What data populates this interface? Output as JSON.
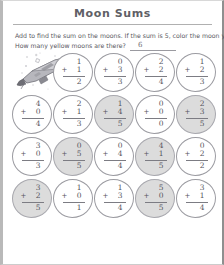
{
  "page": {
    "title": "Moon Sums",
    "instructions": {
      "line1": "Add to find the sum on the moons. If the sum is 5, color the moon yellow.",
      "line2": "How many yellow moons are there?",
      "answer": "6"
    },
    "illustration": "space-shuttle-illustration"
  },
  "colors": {
    "title": "#5f5f66",
    "text": "#57575e",
    "moon_outline": "#9b9ba1",
    "moon_colored_fill": "#dcdcdc",
    "rule": "#b0b0b0"
  },
  "symbols": {
    "plus": "+"
  },
  "rows": [
    {
      "leading_illustration": true,
      "moons": [
        {
          "a": "1",
          "b": "1",
          "sum": "2",
          "colored": false
        },
        {
          "a": "0",
          "b": "3",
          "sum": "3",
          "colored": false
        },
        {
          "a": "2",
          "b": "2",
          "sum": "4",
          "colored": false
        },
        {
          "a": "1",
          "b": "2",
          "sum": "3",
          "colored": false
        }
      ]
    },
    {
      "leading_illustration": false,
      "moons": [
        {
          "a": "4",
          "b": "0",
          "sum": "4",
          "colored": false
        },
        {
          "a": "2",
          "b": "1",
          "sum": "3",
          "colored": false
        },
        {
          "a": "1",
          "b": "4",
          "sum": "5",
          "colored": true
        },
        {
          "a": "0",
          "b": "0",
          "sum": "0",
          "colored": false
        },
        {
          "a": "2",
          "b": "3",
          "sum": "5",
          "colored": true
        }
      ]
    },
    {
      "leading_illustration": false,
      "moons": [
        {
          "a": "3",
          "b": "0",
          "sum": "3",
          "colored": false
        },
        {
          "a": "0",
          "b": "5",
          "sum": "5",
          "colored": true
        },
        {
          "a": "0",
          "b": "4",
          "sum": "4",
          "colored": false
        },
        {
          "a": "4",
          "b": "1",
          "sum": "5",
          "colored": true
        },
        {
          "a": "0",
          "b": "2",
          "sum": "2",
          "colored": false
        }
      ]
    },
    {
      "leading_illustration": false,
      "moons": [
        {
          "a": "3",
          "b": "2",
          "sum": "5",
          "colored": true
        },
        {
          "a": "1",
          "b": "0",
          "sum": "1",
          "colored": false
        },
        {
          "a": "1",
          "b": "3",
          "sum": "4",
          "colored": false
        },
        {
          "a": "5",
          "b": "0",
          "sum": "5",
          "colored": true
        },
        {
          "a": "3",
          "b": "1",
          "sum": "4",
          "colored": false
        }
      ]
    }
  ]
}
